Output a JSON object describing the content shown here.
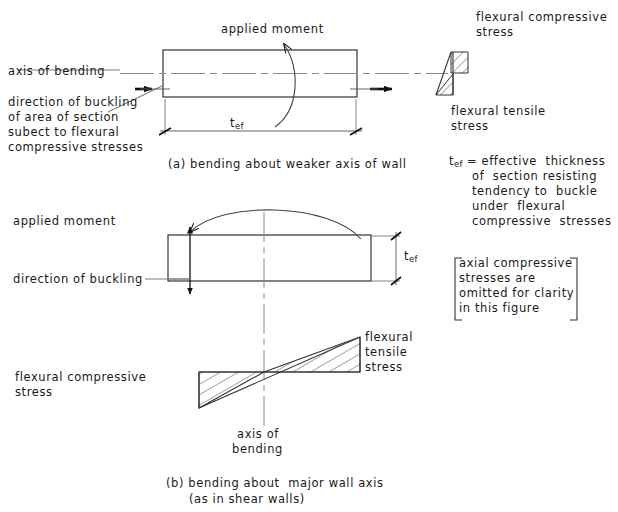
{
  "figure": {
    "stroke_color": "#1a1a1a",
    "centerline_color": "#8a8a8a",
    "hatch_color": "#3a3a3a"
  },
  "diagram_a": {
    "caption": "(a) bending about weaker axis of wall",
    "applied_moment_label": "applied moment",
    "axis_of_bending_label": "axis of bending",
    "direction_of_buckling_block": "direction of buckling\nof area of section\nsubect to flexural\ncompressive stresses",
    "dimension_symbol_base": "t",
    "dimension_symbol_sub": "ef",
    "stress_top_label": "flexural compressive\nstress",
    "stress_bottom_label": "flexural tensile\nstress"
  },
  "diagram_b": {
    "caption_line1": "(b) bending about  major wall axis",
    "caption_line2": "(as in shear walls)",
    "applied_moment_label": "applied moment",
    "direction_of_buckling_label": "direction of buckling",
    "dimension_symbol_base": "t",
    "dimension_symbol_sub": "ef",
    "axis_of_bending_line1": "axis of",
    "axis_of_bending_line2": "bending",
    "stress_tensile_label": "flexural\ntensile\nstress",
    "stress_compressive_label": "flexural compressive\nstress"
  },
  "notes": {
    "tef_definition": {
      "symbol_base": "t",
      "symbol_sub": "ef",
      "equals": "= effective  thickness",
      "lines": [
        "of  section resisting",
        "tendency to  buckle",
        "under  flexural",
        "compressive  stresses"
      ]
    },
    "bracket_note": "axial compressive\nstresses are\nomitted for clarity\nin this figure"
  }
}
